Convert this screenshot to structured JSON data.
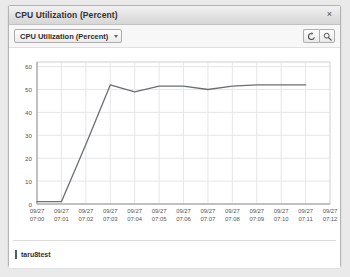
{
  "window": {
    "title": "CPU Utilization (Percent)",
    "close_label": "×",
    "close_icon": "close-icon"
  },
  "toolbar": {
    "metric_select_value": "CPU Utilization (Percent)",
    "metric_select_caret": "chevron-down-icon",
    "refresh_icon": "refresh-icon",
    "zoom_icon": "magnifier-icon"
  },
  "legend": {
    "entries": [
      {
        "label": "taru8test",
        "color": "#555c63"
      }
    ]
  },
  "chart_data": {
    "type": "line",
    "title": "CPU Utilization (Percent)",
    "xlabel": "",
    "ylabel": "",
    "ylim": [
      0,
      62
    ],
    "yticks": [
      0,
      10,
      20,
      30,
      40,
      50,
      60
    ],
    "grid": true,
    "legend_position": "bottom-left",
    "line_color": "#6a6f74",
    "categories": [
      "09/27 07:00",
      "09/27 07:01",
      "09/27 07:02",
      "09/27 07:03",
      "09/27 07:04",
      "09/27 07:05",
      "09/27 07:06",
      "09/27 07:07",
      "09/27 07:08",
      "09/27 07:09",
      "09/27 07:10",
      "09/27 07:11",
      "09/27 07:12"
    ],
    "xtick_lines": [
      [
        "09/27",
        "07:00"
      ],
      [
        "09/27",
        "07:01"
      ],
      [
        "09/27",
        "07:02"
      ],
      [
        "09/27",
        "07:03"
      ],
      [
        "09/27",
        "07:04"
      ],
      [
        "09/27",
        "07:05"
      ],
      [
        "09/27",
        "07:06"
      ],
      [
        "09/27",
        "07:07"
      ],
      [
        "09/27",
        "07:08"
      ],
      [
        "09/27",
        "07:09"
      ],
      [
        "09/27",
        "07:10"
      ],
      [
        "09/27",
        "07:11"
      ],
      [
        "09/27",
        "07:12"
      ]
    ],
    "series": [
      {
        "name": "taru8test",
        "values": [
          1,
          1,
          26,
          52,
          49,
          51.5,
          51.5,
          50,
          51.5,
          52,
          52,
          52,
          null
        ]
      }
    ]
  }
}
